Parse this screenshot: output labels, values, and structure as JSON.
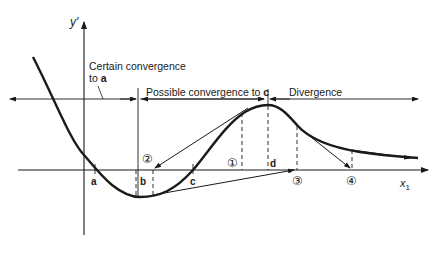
{
  "diagram": {
    "axes": {
      "y_label": "y'",
      "x_label": "x",
      "x_label_sub": "1"
    },
    "points": {
      "a": "a",
      "b": "b",
      "c": "c",
      "d": "d"
    },
    "regions": {
      "certain_line1": "Certain convergence",
      "certain_line2_prefix": "to ",
      "certain_target": "a",
      "possible_prefix": "Possible convergence to ",
      "possible_target": "c",
      "divergence": "Divergence"
    },
    "markers": [
      "①",
      "②",
      "③",
      "④"
    ],
    "colors": {
      "ink": "#1a1a1a",
      "background": "#ffffff"
    }
  }
}
